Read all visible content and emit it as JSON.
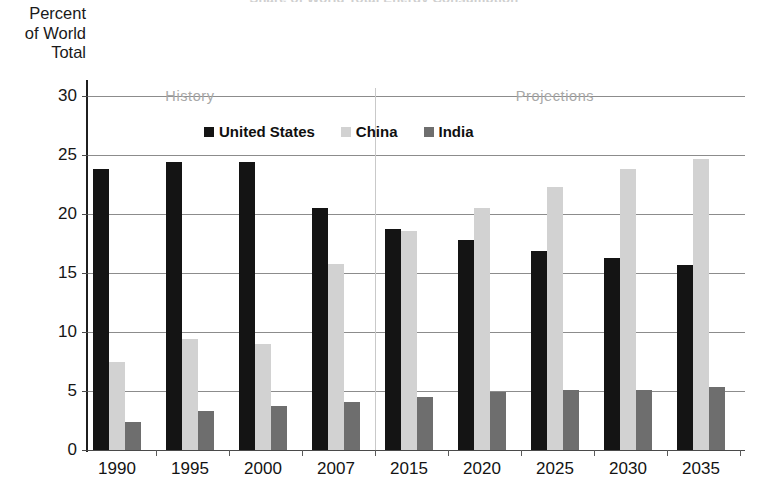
{
  "figure": {
    "clipped_title": "Share of World Total Energy Consumption",
    "y_axis_caption": [
      "Percent",
      "of World",
      "Total"
    ],
    "section_labels": [
      {
        "text": "History",
        "at_category": "1995"
      },
      {
        "text": "Projections",
        "at_category": "2025"
      }
    ]
  },
  "colors": {
    "united_states": "#141414",
    "china": "#d2d2d2",
    "india": "#6e6e6e",
    "gridline": "#8c8c8c",
    "axis": "#1f1f1f",
    "section_label": "#a8a8a8",
    "divider": "#c9c9c9",
    "background": "#ffffff"
  },
  "chart_data": {
    "type": "bar",
    "title": "Share of World Total Energy Consumption",
    "xlabel": "",
    "ylabel": "Percent of World Total",
    "ylim": [
      0,
      30
    ],
    "yticks": [
      0,
      5,
      10,
      15,
      20,
      25,
      30
    ],
    "grid": true,
    "legend_position": "top-center",
    "categories": [
      "1990",
      "1995",
      "2000",
      "2007",
      "2015",
      "2020",
      "2025",
      "2030",
      "2035"
    ],
    "series": [
      {
        "name": "United States",
        "color": "#141414",
        "values": [
          23.8,
          24.4,
          24.4,
          20.5,
          18.7,
          17.8,
          16.9,
          16.3,
          15.7
        ]
      },
      {
        "name": "China",
        "color": "#d2d2d2",
        "values": [
          7.5,
          9.4,
          9.0,
          15.8,
          18.6,
          20.5,
          22.3,
          23.8,
          24.7
        ]
      },
      {
        "name": "India",
        "color": "#6e6e6e",
        "values": [
          2.4,
          3.3,
          3.7,
          4.1,
          4.5,
          4.9,
          5.1,
          5.1,
          5.3
        ]
      }
    ],
    "annotations": [
      {
        "text": "History",
        "span": [
          "1990",
          "2007"
        ]
      },
      {
        "text": "Projections",
        "span": [
          "2015",
          "2035"
        ]
      }
    ]
  }
}
